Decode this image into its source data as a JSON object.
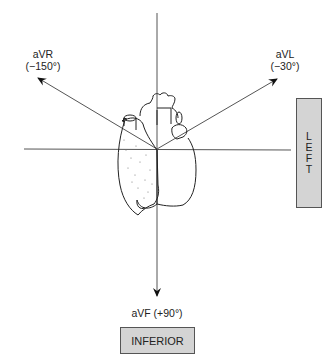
{
  "diagram": {
    "leads": {
      "avr": {
        "name": "aVR",
        "angle": "(−150°)"
      },
      "avl": {
        "name": "aVL",
        "angle": "(−30°)"
      },
      "avf": {
        "label": "aVF (+90°)"
      }
    },
    "boxes": {
      "left": {
        "letters": [
          "L",
          "E",
          "F",
          "T"
        ]
      },
      "inferior": {
        "label": "INFERIOR"
      }
    },
    "colors": {
      "axis_line": "#555555",
      "box_fill": "#d4d4d4",
      "box_border": "#555555",
      "heart_outline": "#222222"
    }
  }
}
